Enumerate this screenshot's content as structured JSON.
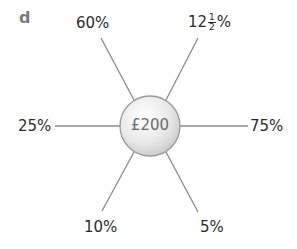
{
  "part_label": "d",
  "center": {
    "value": "£200"
  },
  "spokes": [
    {
      "id": "top-left",
      "label": "60%"
    },
    {
      "id": "top-right",
      "label_whole": "12",
      "label_num": "1",
      "label_den": "2",
      "label_suffix": "%",
      "label": "12½%"
    },
    {
      "id": "left",
      "label": "25%"
    },
    {
      "id": "right",
      "label": "75%"
    },
    {
      "id": "bottom-left",
      "label": "10%"
    },
    {
      "id": "bottom-right",
      "label": "5%"
    }
  ],
  "colors": {
    "line": "#8a8a8a",
    "circle_border": "#9a9a9a",
    "text": "#2b2b2b",
    "part_label": "#7a7a7a"
  }
}
